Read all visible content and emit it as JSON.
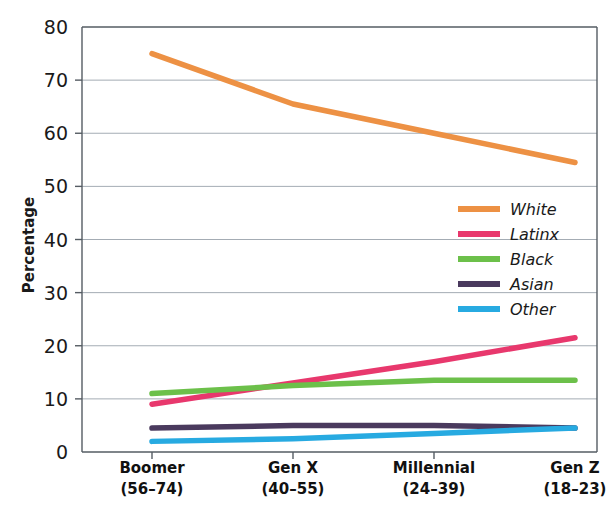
{
  "chart_data": {
    "type": "line",
    "title": "",
    "xlabel": "",
    "ylabel": "Percentage",
    "ylim": [
      0,
      80
    ],
    "ytick_step": 10,
    "yticks": [
      "0",
      "10",
      "20",
      "30",
      "40",
      "50",
      "60",
      "70",
      "80"
    ],
    "grid": true,
    "grid_axis": "y",
    "legend_position": "center-right inside plot",
    "categories": [
      "Boomer",
      "Gen X",
      "Millennial",
      "Gen Z"
    ],
    "category_sublabels": [
      "(56–74)",
      "(40–55)",
      "(24–39)",
      "(18–23)"
    ],
    "series": [
      {
        "name": "White",
        "color": "#ED9144",
        "values": [
          75.0,
          65.5,
          60.0,
          54.5
        ]
      },
      {
        "name": "Latinx",
        "color": "#E8386D",
        "values": [
          9.0,
          13.0,
          17.0,
          21.5
        ]
      },
      {
        "name": "Black",
        "color": "#6CC04A",
        "values": [
          11.0,
          12.5,
          13.5,
          13.5
        ]
      },
      {
        "name": "Asian",
        "color": "#4A3A5E",
        "values": [
          4.5,
          5.0,
          5.0,
          4.5
        ]
      },
      {
        "name": "Other",
        "color": "#27AAE1",
        "values": [
          2.0,
          2.5,
          3.5,
          4.5
        ]
      }
    ]
  },
  "axes": {
    "y_axis_title": "Percentage"
  },
  "legend": {
    "entries": [
      {
        "label": "White"
      },
      {
        "label": "Latinx"
      },
      {
        "label": "Black"
      },
      {
        "label": "Asian"
      },
      {
        "label": "Other"
      }
    ]
  },
  "colors": {
    "white_series": "#ED9144",
    "latinx_series": "#E8386D",
    "black_series": "#6CC04A",
    "asian_series": "#4A3A5E",
    "other_series": "#27AAE1",
    "gridline": "#9aa3ab",
    "frame": "#555c63",
    "text": "#1a1a1a",
    "background": "#ffffff"
  }
}
